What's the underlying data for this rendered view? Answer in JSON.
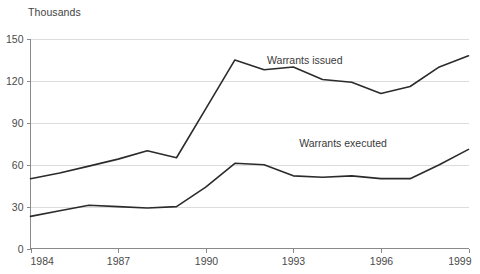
{
  "chart_data": {
    "type": "line",
    "title": "",
    "subtitle": "",
    "unit_label": "Thousands",
    "xlabel": "",
    "ylabel": "",
    "xlim": [
      1984,
      1999
    ],
    "ylim": [
      0,
      150
    ],
    "x_tick_labels": [
      "1984",
      "1987",
      "1990",
      "1993",
      "1996",
      "1999"
    ],
    "x_tick_values": [
      1984,
      1987,
      1990,
      1993,
      1996,
      1999
    ],
    "y_tick_labels": [
      "0",
      "30",
      "60",
      "90",
      "120",
      "150"
    ],
    "y_tick_values": [
      0,
      30,
      60,
      90,
      120,
      150
    ],
    "grid": "horizontal",
    "legend_position": "inline-annotation",
    "x": [
      1984,
      1985,
      1986,
      1987,
      1988,
      1989,
      1990,
      1991,
      1992,
      1993,
      1994,
      1995,
      1996,
      1997,
      1998,
      1999
    ],
    "series": [
      {
        "name": "Warrants issued",
        "color": "#2b2b2b",
        "label_x": 1992.1,
        "label_y": 132,
        "values": [
          50,
          54,
          59,
          64,
          70,
          65,
          100,
          135,
          128,
          130,
          121,
          119,
          111,
          116,
          130,
          138
        ]
      },
      {
        "name": "Warrants executed",
        "color": "#2b2b2b",
        "label_x": 1993.2,
        "label_y": 73,
        "values": [
          23,
          27,
          31,
          30,
          29,
          30,
          44,
          61,
          60,
          52,
          51,
          52,
          50,
          50,
          60,
          71
        ]
      }
    ],
    "annotations": [
      {
        "text": "Warrants issued",
        "x": 1992.1,
        "y": 132
      },
      {
        "text": "Warrants executed",
        "x": 1993.2,
        "y": 73
      }
    ]
  }
}
